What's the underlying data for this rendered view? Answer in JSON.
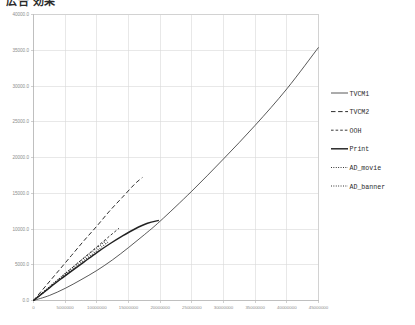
{
  "title": "広告 効果",
  "chart_data": {
    "type": "line",
    "title": "広告 効果",
    "xlabel": "",
    "ylabel": "",
    "xlim": [
      0,
      45000000
    ],
    "ylim": [
      0,
      40000
    ],
    "grid": true,
    "legend_position": "right",
    "x_ticks": [
      0,
      5000000,
      10000000,
      15000000,
      20000000,
      25000000,
      30000000,
      35000000,
      40000000,
      45000000
    ],
    "x_tick_labels": [
      "0",
      "5000000",
      "10000000",
      "15000000",
      "20000000",
      "25000000",
      "30000000",
      "35000000",
      "40000000",
      "45000000"
    ],
    "y_ticks": [
      0,
      5000,
      10000,
      15000,
      20000,
      25000,
      30000,
      35000,
      40000
    ],
    "y_tick_labels": [
      "0.0",
      "5000.0",
      "10000.0",
      "15000.0",
      "20000.0",
      "25000.0",
      "30000.0",
      "35000.0",
      "40000.0"
    ],
    "series": [
      {
        "name": "TVCM1",
        "style": "solid",
        "x": [
          0,
          2500000,
          5000000,
          7500000,
          10000000,
          12500000,
          15000000,
          17500000,
          20000000,
          25000000,
          30000000,
          35000000,
          40000000,
          45000000
        ],
        "y": [
          0,
          700,
          1700,
          2900,
          4200,
          5700,
          7400,
          9200,
          11100,
          15300,
          19800,
          24500,
          29600,
          35400
        ]
      },
      {
        "name": "TVCM2",
        "style": "dashed",
        "x": [
          0,
          2000000,
          4000000,
          6000000,
          8000000,
          10000000,
          12000000,
          14000000,
          16000000,
          17200000
        ],
        "y": [
          0,
          2100,
          4200,
          6300,
          8400,
          10400,
          12500,
          14400,
          16300,
          17200
        ]
      },
      {
        "name": "OOH",
        "style": "dashed-short",
        "x": [
          0,
          2000000,
          4000000,
          6000000,
          8000000,
          10000000,
          12000000,
          13500000
        ],
        "y": [
          0,
          1500,
          3000,
          4500,
          6000,
          7500,
          9000,
          10100
        ]
      },
      {
        "name": "Print",
        "style": "solid-thick",
        "x": [
          0,
          2000000,
          4000000,
          6000000,
          8000000,
          10000000,
          12000000,
          14000000,
          16000000,
          18000000,
          19800000
        ],
        "y": [
          0,
          1400,
          2800,
          4100,
          5400,
          6700,
          7900,
          9000,
          10000,
          10800,
          11200
        ]
      },
      {
        "name": "AD_movie",
        "style": "dotted",
        "x": [
          0,
          1500000,
          3000000,
          4500000,
          6000000,
          7500000,
          9000000,
          10500000,
          11500000
        ],
        "y": [
          0,
          1150,
          2300,
          3400,
          4500,
          5600,
          6650,
          7700,
          8400
        ]
      },
      {
        "name": "AD_banner",
        "style": "dotted",
        "x": [
          0,
          1500000,
          3000000,
          4500000,
          6000000,
          7500000,
          9000000,
          10500000,
          11800000
        ],
        "y": [
          0,
          1050,
          2150,
          3200,
          4250,
          5300,
          6300,
          7300,
          8200
        ]
      }
    ],
    "legend": [
      {
        "label": "TVCM1",
        "style": "solid"
      },
      {
        "label": "TVCM2",
        "style": "dashed"
      },
      {
        "label": "OOH",
        "style": "dashed-short"
      },
      {
        "label": "Print",
        "style": "solid-thick"
      },
      {
        "label": "AD_movie",
        "style": "dotted"
      },
      {
        "label": "AD_banner",
        "style": "dotted"
      }
    ]
  },
  "colors": {
    "series": "#222222",
    "grid": "#d9d9d9",
    "axis": "#b4b4b4",
    "tick_text": "#8d8d8d",
    "legend_text": "#2c2c2c",
    "background": "#ffffff"
  }
}
